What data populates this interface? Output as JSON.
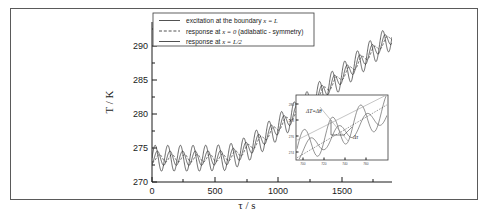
{
  "figure": {
    "background_color": "#ffffff",
    "frame_color": "#5a5a5a",
    "line_color": "#262626"
  },
  "chart_data": {
    "type": "line",
    "title": "",
    "xlabel": "τ / s",
    "ylabel": "T / K",
    "xlim": [
      0,
      1900
    ],
    "ylim": [
      270,
      292
    ],
    "xticks": [
      0,
      500,
      1000,
      1500
    ],
    "xticklabels": [
      "0",
      "500",
      "1000",
      "1500"
    ],
    "yticks": [
      270,
      275,
      280,
      285,
      290
    ],
    "yticklabels": [
      "270",
      "275",
      "280",
      "285",
      "290"
    ],
    "grid": false,
    "legend_position": "upper center",
    "series": [
      {
        "name": "excitation at the boundary x = L",
        "style": "solid",
        "amplitude": 1.9,
        "phase": 0.0,
        "period": 100,
        "description": "largest amplitude oscillation, leads the others"
      },
      {
        "name": "response at x = 0 (adiabatic  - symmetry)",
        "style": "dashed",
        "amplitude": 0.55,
        "phase": 2.1,
        "period": 100,
        "description": "smallest amplitude, most lagged, adiabatic symmetry plane"
      },
      {
        "name": "response at x = L/2",
        "style": "solid",
        "amplitude": 1.05,
        "phase": 1.1,
        "period": 100,
        "description": "intermediate amplitude and phase lag"
      }
    ],
    "baseline_description": "mean temperature ~273.5 K flat until tau~650 s then rising roughly linearly to ~291 K at tau=1900 s",
    "baseline_points": [
      {
        "tau": 0,
        "T": 273.5
      },
      {
        "tau": 200,
        "T": 273.5
      },
      {
        "tau": 400,
        "T": 273.5
      },
      {
        "tau": 600,
        "T": 273.6
      },
      {
        "tau": 700,
        "T": 274.3
      },
      {
        "tau": 800,
        "T": 275.4
      },
      {
        "tau": 900,
        "T": 276.7
      },
      {
        "tau": 1000,
        "T": 278.1
      },
      {
        "tau": 1100,
        "T": 279.5
      },
      {
        "tau": 1200,
        "T": 281.0
      },
      {
        "tau": 1300,
        "T": 282.5
      },
      {
        "tau": 1400,
        "T": 284.0
      },
      {
        "tau": 1500,
        "T": 285.5
      },
      {
        "tau": 1600,
        "T": 287.0
      },
      {
        "tau": 1700,
        "T": 288.5
      },
      {
        "tau": 1800,
        "T": 290.0
      },
      {
        "tau": 1900,
        "T": 291.4
      }
    ]
  },
  "legend": {
    "entries": [
      {
        "label_plain": "excitation at the boundary ",
        "label_italic": "x = L",
        "style": "solid"
      },
      {
        "label_plain": "response at ",
        "label_italic": "x = 0",
        "label_tail": " (adiabatic  - symmetry)",
        "style": "dashed"
      },
      {
        "label_plain": "response at ",
        "label_italic": "x = L/2",
        "style": "solid"
      }
    ]
  },
  "inset": {
    "type": "line",
    "annotations": [
      {
        "text": "ΔT=Δθ",
        "position": "upper-left"
      },
      {
        "text": "Δτ",
        "position": "lower-right"
      }
    ],
    "xticklabels": [
      "700",
      "720",
      "740",
      "760"
    ],
    "yticklabels": [
      "280",
      "278",
      "276",
      "274"
    ],
    "description": "zoom of the transition region showing the temperature amplitude difference and the time shift between excitation and response"
  }
}
